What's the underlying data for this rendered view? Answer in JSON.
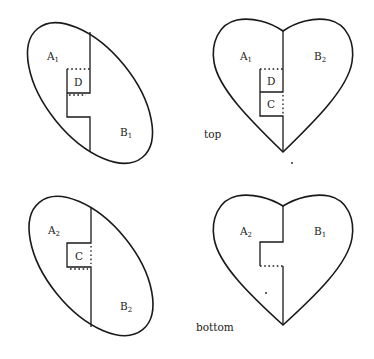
{
  "figure": {
    "captions": {
      "top": "top",
      "bottom": "bottom"
    },
    "panels": [
      {
        "id": "ellipse-top",
        "shape": "ellipse",
        "regions": [
          {
            "letter": "A",
            "sub": "1"
          },
          {
            "letter": "B",
            "sub": "1"
          },
          {
            "letter": "D",
            "sub": ""
          }
        ]
      },
      {
        "id": "heart-top",
        "shape": "heart",
        "regions": [
          {
            "letter": "A",
            "sub": "1"
          },
          {
            "letter": "B",
            "sub": "2"
          },
          {
            "letter": "D",
            "sub": ""
          },
          {
            "letter": "C",
            "sub": ""
          }
        ]
      },
      {
        "id": "ellipse-bottom",
        "shape": "ellipse",
        "regions": [
          {
            "letter": "A",
            "sub": "2"
          },
          {
            "letter": "B",
            "sub": "2"
          },
          {
            "letter": "C",
            "sub": ""
          }
        ]
      },
      {
        "id": "heart-bottom",
        "shape": "heart",
        "regions": [
          {
            "letter": "A",
            "sub": "2"
          },
          {
            "letter": "B",
            "sub": "1"
          }
        ]
      }
    ]
  }
}
